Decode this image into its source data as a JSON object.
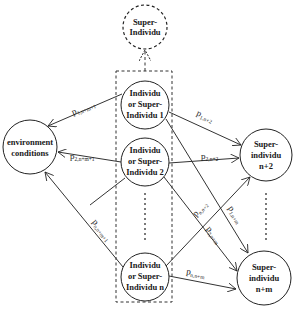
{
  "diagram": {
    "nodes": {
      "super_top": {
        "line1": "Super-",
        "line2": "Individu"
      },
      "ind1": {
        "line1": "Individu",
        "line2": "or Super-",
        "line3": "Individu 1"
      },
      "ind2": {
        "line1": "Individu",
        "line2": "or Super-",
        "line3": "Individu 2"
      },
      "indn": {
        "line1": "Individu",
        "line2": "or Super-",
        "line3": "Individu n"
      },
      "env": {
        "line1": "environment",
        "line2": "conditions"
      },
      "sup_n2": {
        "line1": "Super-",
        "line2": "individu",
        "line3": "n+2"
      },
      "sup_nm": {
        "line1": "Super-",
        "line2": "individu",
        "line3": "n+m"
      }
    },
    "edges": {
      "e1_env": {
        "p": "p",
        "sub": "1,n+m+1"
      },
      "e2_env": {
        "p": "p",
        "sub": "2,n+m+1"
      },
      "en_env": {
        "p": "p",
        "sub": "n,n+m+1"
      },
      "e1_n2": {
        "p": "p",
        "sub": "1,n+2"
      },
      "e2_n2": {
        "p": "p",
        "sub": "2,n+2"
      },
      "en_n2": {
        "p": "p",
        "sub": "n,n+2"
      },
      "e1_nm": {
        "p": "p",
        "sub": "1,n+m"
      },
      "e2_nm": {
        "p": "p",
        "sub": "2,n+m"
      },
      "en_nm": {
        "p": "p",
        "sub": "n,n+m"
      }
    }
  }
}
